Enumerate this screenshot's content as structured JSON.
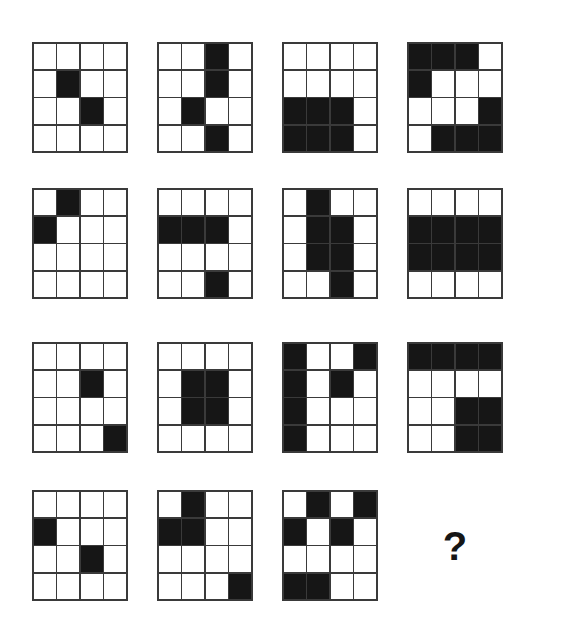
{
  "puzzle": {
    "type": "matrix-reasoning-grid-puzzle",
    "layout": {
      "rows": 4,
      "columns": 4,
      "grid_size": 4,
      "cell_width_px": 96,
      "cell_height_px": 111,
      "column_x_px": [
        32,
        157,
        282,
        407
      ],
      "row_y_px": [
        42,
        188,
        342,
        490
      ]
    },
    "colors": {
      "background": "#ffffff",
      "filled_square": "#161616",
      "grid_line": "#3a3a3a",
      "empty_square": "#ffffff",
      "question_mark": "#161616"
    },
    "answer_placeholder": "?",
    "cells": [
      {
        "index": 1,
        "name": "grid-r1c1",
        "filled": [
          [
            0,
            0,
            0,
            0
          ],
          [
            0,
            1,
            0,
            0
          ],
          [
            0,
            0,
            1,
            0
          ],
          [
            0,
            0,
            0,
            0
          ]
        ]
      },
      {
        "index": 2,
        "name": "grid-r1c2",
        "filled": [
          [
            0,
            0,
            1,
            0
          ],
          [
            0,
            0,
            1,
            0
          ],
          [
            0,
            1,
            0,
            0
          ],
          [
            0,
            0,
            1,
            0
          ]
        ]
      },
      {
        "index": 3,
        "name": "grid-r1c3",
        "filled": [
          [
            0,
            0,
            0,
            0
          ],
          [
            0,
            0,
            0,
            0
          ],
          [
            1,
            1,
            1,
            0
          ],
          [
            1,
            1,
            1,
            0
          ]
        ]
      },
      {
        "index": 4,
        "name": "grid-r1c4",
        "filled": [
          [
            1,
            1,
            1,
            0
          ],
          [
            1,
            0,
            0,
            0
          ],
          [
            0,
            0,
            0,
            1
          ],
          [
            0,
            1,
            1,
            1
          ]
        ]
      },
      {
        "index": 5,
        "name": "grid-r2c1",
        "filled": [
          [
            0,
            1,
            0,
            0
          ],
          [
            1,
            0,
            0,
            0
          ],
          [
            0,
            0,
            0,
            0
          ],
          [
            0,
            0,
            0,
            0
          ]
        ]
      },
      {
        "index": 6,
        "name": "grid-r2c2",
        "filled": [
          [
            0,
            0,
            0,
            0
          ],
          [
            1,
            1,
            1,
            0
          ],
          [
            0,
            0,
            0,
            0
          ],
          [
            0,
            0,
            1,
            0
          ]
        ]
      },
      {
        "index": 7,
        "name": "grid-r2c3",
        "filled": [
          [
            0,
            1,
            0,
            0
          ],
          [
            0,
            1,
            1,
            0
          ],
          [
            0,
            1,
            1,
            0
          ],
          [
            0,
            0,
            1,
            0
          ]
        ]
      },
      {
        "index": 8,
        "name": "grid-r2c4",
        "filled": [
          [
            0,
            0,
            0,
            0
          ],
          [
            1,
            1,
            1,
            1
          ],
          [
            1,
            1,
            1,
            1
          ],
          [
            0,
            0,
            0,
            0
          ]
        ]
      },
      {
        "index": 9,
        "name": "grid-r3c1",
        "filled": [
          [
            0,
            0,
            0,
            0
          ],
          [
            0,
            0,
            1,
            0
          ],
          [
            0,
            0,
            0,
            0
          ],
          [
            0,
            0,
            0,
            1
          ]
        ]
      },
      {
        "index": 10,
        "name": "grid-r3c2",
        "filled": [
          [
            0,
            0,
            0,
            0
          ],
          [
            0,
            1,
            1,
            0
          ],
          [
            0,
            1,
            1,
            0
          ],
          [
            0,
            0,
            0,
            0
          ]
        ]
      },
      {
        "index": 11,
        "name": "grid-r3c3",
        "filled": [
          [
            1,
            0,
            0,
            1
          ],
          [
            1,
            0,
            1,
            0
          ],
          [
            1,
            0,
            0,
            0
          ],
          [
            1,
            0,
            0,
            0
          ]
        ]
      },
      {
        "index": 12,
        "name": "grid-r3c4",
        "filled": [
          [
            1,
            1,
            1,
            1
          ],
          [
            0,
            0,
            0,
            0
          ],
          [
            0,
            0,
            1,
            1
          ],
          [
            0,
            0,
            1,
            1
          ]
        ]
      },
      {
        "index": 13,
        "name": "grid-r4c1",
        "filled": [
          [
            0,
            0,
            0,
            0
          ],
          [
            1,
            0,
            0,
            0
          ],
          [
            0,
            0,
            1,
            0
          ],
          [
            0,
            0,
            0,
            0
          ]
        ]
      },
      {
        "index": 14,
        "name": "grid-r4c2",
        "filled": [
          [
            0,
            1,
            0,
            0
          ],
          [
            1,
            1,
            0,
            0
          ],
          [
            0,
            0,
            0,
            0
          ],
          [
            0,
            0,
            0,
            1
          ]
        ]
      },
      {
        "index": 15,
        "name": "grid-r4c3",
        "filled": [
          [
            0,
            1,
            0,
            1
          ],
          [
            1,
            0,
            1,
            0
          ],
          [
            0,
            0,
            0,
            0
          ],
          [
            1,
            1,
            0,
            0
          ]
        ]
      }
    ]
  }
}
